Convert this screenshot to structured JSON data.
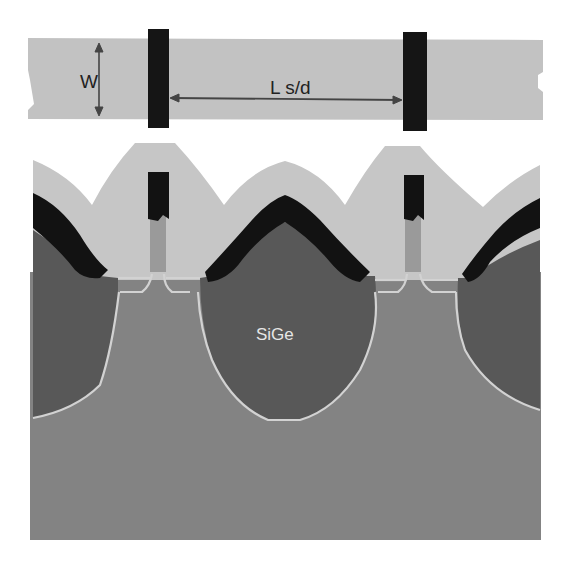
{
  "figure": {
    "type": "semiconductor cross-section diagram (embedded SiGe source/drain transistor)",
    "top_view": {
      "labels": {
        "width": "W",
        "source_drain_length": "L s/d"
      }
    },
    "cross_section": {
      "labels": {
        "sige_region": "SiGe"
      }
    },
    "colors": {
      "background": "#ffffff",
      "active_band": "#c2c2c2",
      "gate": "#151515",
      "spacer_oxide": "#c6c6c6",
      "sige": "#585858",
      "substrate": "#838383",
      "silicide_cap": "#121212",
      "gate_poly": "#9a9a9a",
      "junction_line": "#d2d2d2",
      "dimension_arrow": "#444444"
    }
  }
}
